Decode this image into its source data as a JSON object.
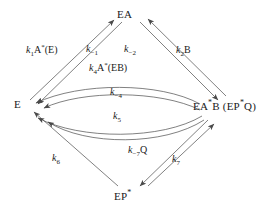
{
  "figure": {
    "type": "reaction-scheme"
  },
  "nodes": [
    {
      "id": "EA",
      "main": "EA",
      "star": "",
      "tail": "",
      "pos": "top"
    },
    {
      "id": "E",
      "main": "E",
      "star": "",
      "tail": "",
      "pos": "left"
    },
    {
      "id": "EASTARB",
      "main": "EA",
      "star": "*",
      "tail": "B (EP*Q)",
      "pos": "right"
    },
    {
      "id": "EPSTAR",
      "main": "EP",
      "star": "*",
      "tail": "",
      "pos": "bottom"
    }
  ],
  "node_labels": {
    "top": "EA",
    "left": "E",
    "right_part1": "EA",
    "right_star": "*",
    "right_part2": "B (EP",
    "right_star2": "*",
    "right_part3": "Q)",
    "bottom_part1": "EP",
    "bottom_star": "*"
  },
  "rates": [
    {
      "id": "k1",
      "k": "k",
      "sub": "1",
      "suffix": "A",
      "sup": "*",
      "tail": "(E)"
    },
    {
      "id": "km1",
      "k": "k",
      "sub": "-1",
      "suffix": "",
      "sup": "",
      "tail": ""
    },
    {
      "id": "km2",
      "k": "k",
      "sub": "-2",
      "suffix": "",
      "sup": "",
      "tail": ""
    },
    {
      "id": "k2",
      "k": "k",
      "sub": "2",
      "suffix": "B",
      "sup": "",
      "tail": ""
    },
    {
      "id": "k4",
      "k": "k",
      "sub": "4",
      "suffix": "A",
      "sup": "*",
      "tail": "(EB)"
    },
    {
      "id": "km4",
      "k": "k",
      "sub": "-4",
      "suffix": "",
      "sup": "",
      "tail": ""
    },
    {
      "id": "k5",
      "k": "k",
      "sub": "5",
      "suffix": "",
      "sup": "",
      "tail": ""
    },
    {
      "id": "k6",
      "k": "k",
      "sub": "6",
      "suffix": "",
      "sup": "",
      "tail": ""
    },
    {
      "id": "km7",
      "k": "k",
      "sub": "-7",
      "suffix": "Q",
      "sup": "",
      "tail": ""
    },
    {
      "id": "k7",
      "k": "k",
      "sub": "7",
      "suffix": "",
      "sup": "",
      "tail": ""
    }
  ],
  "rate_text": {
    "k1_k": "k",
    "k1_sub": "1",
    "k1_tail": "A",
    "k1_sup": "*",
    "k1_end": "(E)",
    "km1_k": "k",
    "km1_sub": "−1",
    "km2_k": "k",
    "km2_sub": "−2",
    "k2_k": "k",
    "k2_sub": "2",
    "k2_tail": "B",
    "k4_k": "k",
    "k4_sub": "4",
    "k4_tail": "A",
    "k4_sup": "*",
    "k4_end": "(EB)",
    "km4_k": "k",
    "km4_sub": "−4",
    "k5_k": "k",
    "k5_sub": "5",
    "k6_k": "k",
    "k6_sub": "6",
    "km7_k": "k",
    "km7_sub": "−7",
    "km7_tail": "Q",
    "k7_k": "k",
    "k7_sub": "7"
  },
  "colors": {
    "stroke": "#4a4a4a",
    "text": "#1a1a1a",
    "background": "#ffffff"
  }
}
